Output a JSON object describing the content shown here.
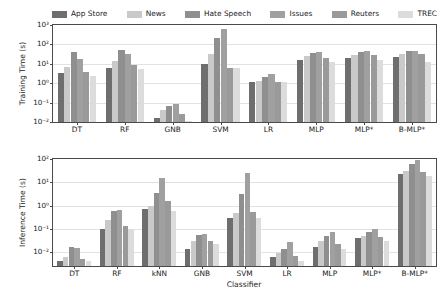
{
  "legend": {
    "position": "above-plot",
    "entries": [
      {
        "label": "App Store",
        "color": "#6e6e6e"
      },
      {
        "label": "News",
        "color": "#c9c9c9"
      },
      {
        "label": "Hate Speech",
        "color": "#8f8f8f"
      },
      {
        "label": "Issues",
        "color": "#a0a0a0"
      },
      {
        "label": "Reuters",
        "color": "#9a9a9a"
      },
      {
        "label": "TREC",
        "color": "#dcdcdc"
      }
    ]
  },
  "chart_data": [
    {
      "type": "bar",
      "title": "",
      "xlabel": "",
      "ylabel": "Training Time (s)",
      "yscale": "log",
      "ylim": [
        0.01,
        1000
      ],
      "yticks": [
        "10$^{-2}$",
        "10$^{-1}$",
        "10$^{0}$",
        "10$^{1}$",
        "10$^{2}$",
        "10$^{3}$"
      ],
      "ytick_labels": [
        "10⁻²",
        "10⁻¹",
        "10⁰",
        "10¹",
        "10²",
        "10³"
      ],
      "ytick_values": [
        0.01,
        0.1,
        1,
        10,
        100,
        1000
      ],
      "grid": true,
      "categories": [
        "DT",
        "RF",
        "GNB",
        "SVM",
        "LR",
        "MLP",
        "MLP*",
        "B-MLP*"
      ],
      "series": [
        {
          "name": "App Store",
          "color": "#6e6e6e",
          "values": [
            3.2,
            6.2,
            0.017,
            9.5,
            1.1,
            16.0,
            21.0,
            22.0
          ]
        },
        {
          "name": "News",
          "color": "#c9c9c9",
          "values": [
            6.5,
            14.0,
            0.04,
            31.0,
            1.3,
            25.0,
            30.0,
            32.0
          ]
        },
        {
          "name": "Hate Speech",
          "color": "#8f8f8f",
          "values": [
            41.0,
            52.0,
            0.07,
            210.0,
            2.0,
            38.0,
            43.0,
            44.0
          ]
        },
        {
          "name": "Issues",
          "color": "#a0a0a0",
          "values": [
            17.0,
            34.0,
            0.09,
            620.0,
            3.0,
            40.0,
            45.0,
            46.0
          ]
        },
        {
          "name": "Reuters",
          "color": "#9a9a9a",
          "values": [
            3.6,
            9.0,
            0.026,
            6.2,
            1.2,
            21.0,
            30.0,
            31.0
          ]
        },
        {
          "name": "TREC",
          "color": "#dcdcdc",
          "values": [
            2.3,
            5.2,
            0.011,
            6.0,
            1.1,
            12.0,
            16.0,
            12.0
          ]
        }
      ]
    },
    {
      "type": "bar",
      "title": "",
      "xlabel": "Classifier",
      "ylabel": "Inference Time (s)",
      "yscale": "log",
      "ylim": [
        0.0025,
        100
      ],
      "ytick_labels": [
        "10⁻²",
        "10⁻¹",
        "10⁰",
        "10¹",
        "10²"
      ],
      "ytick_values": [
        0.01,
        0.1,
        1,
        10,
        100
      ],
      "grid": true,
      "categories": [
        "DT",
        "RF",
        "kNN",
        "GNB",
        "SVM",
        "LR",
        "MLP",
        "MLP*",
        "B-MLP*"
      ],
      "series": [
        {
          "name": "App Store",
          "color": "#6e6e6e",
          "values": [
            0.0042,
            0.1,
            0.7,
            0.014,
            0.3,
            0.006,
            0.016,
            0.04,
            22.0
          ]
        },
        {
          "name": "News",
          "color": "#c9c9c9",
          "values": [
            0.006,
            0.25,
            0.95,
            0.03,
            0.5,
            0.009,
            0.03,
            0.05,
            30.0
          ]
        },
        {
          "name": "Hate Speech",
          "color": "#8f8f8f",
          "values": [
            0.017,
            0.6,
            3.5,
            0.055,
            3.0,
            0.014,
            0.05,
            0.075,
            60.0
          ]
        },
        {
          "name": "Issues",
          "color": "#a0a0a0",
          "values": [
            0.015,
            0.62,
            15.0,
            0.062,
            25.0,
            0.026,
            0.07,
            0.1,
            95.0
          ]
        },
        {
          "name": "Reuters",
          "color": "#9a9a9a",
          "values": [
            0.0048,
            0.13,
            1.5,
            0.03,
            0.55,
            0.0065,
            0.022,
            0.045,
            28.0
          ]
        },
        {
          "name": "TREC",
          "color": "#dcdcdc",
          "values": [
            0.004,
            0.1,
            0.6,
            0.022,
            0.28,
            0.0042,
            0.014,
            0.03,
            18.0
          ]
        }
      ]
    }
  ]
}
